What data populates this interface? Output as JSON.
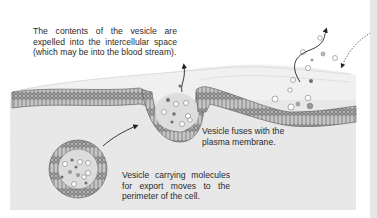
{
  "diagram": {
    "labels": {
      "expelled": {
        "lines": [
          "The contents of the vesicle are",
          "expelled into the intercellular space",
          "(which may be into the blood stream)."
        ]
      },
      "fuses": {
        "lines": [
          "Vesicle fuses with the",
          "plasma membrane."
        ]
      },
      "carrying": {
        "lines": [
          "Vesicle carrying molecules",
          "for export moves to the",
          "perimeter of the cell."
        ]
      }
    },
    "components": [
      "intercellular-space",
      "plasma-membrane-bilayer",
      "cytoplasm",
      "transport-vesicle",
      "fusing-vesicle",
      "released-molecules",
      "arrows"
    ],
    "colors": {
      "cytoplasm": "#e9e9e9",
      "extracellular": "#f1f1f1",
      "membrane_head": "#8a8a8a",
      "membrane_outline": "#5a5a5a",
      "vesicle_lumen": "#dcdcdc",
      "molecule_dark": "#6e6e6e",
      "molecule_light": "#ffffff",
      "text": "#2a2a2a",
      "arrow": "#222222"
    }
  }
}
